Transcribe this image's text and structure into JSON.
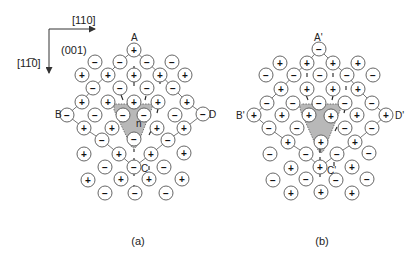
{
  "axes": {
    "horizontal_label": "[110]",
    "vertical_label": "[1̅ 1̅0]",
    "vertical_label_text": "[11̅0]",
    "plane_label": "(001)",
    "origin": [
      49,
      29
    ],
    "h_end": [
      95,
      29
    ],
    "v_end": [
      49,
      73
    ]
  },
  "panels": [
    {
      "id": "a",
      "caption": "(a)",
      "caption_pos": [
        138,
        245
      ],
      "labels": [
        {
          "text": "A",
          "x": 131,
          "y": 41
        },
        {
          "text": "B",
          "x": 55,
          "y": 118
        },
        {
          "text": "D",
          "x": 209,
          "y": 118
        },
        {
          "text": "C",
          "x": 141,
          "y": 172
        },
        {
          "text": "n",
          "x": 136,
          "y": 127
        }
      ],
      "shade": "M114,106 Q113,104 117,104 L149,104 Q153,104 152,108 L137,146 Q134,150 131,146 L114,110 Z",
      "bonds": [
        [
          [
            134,
            50
          ],
          [
            120,
            62
          ],
          [
            108,
            74
          ],
          [
            93,
            88
          ],
          [
            82,
            102
          ],
          [
            67,
            115
          ]
        ],
        [
          [
            134,
            50
          ],
          [
            147,
            62
          ],
          [
            160,
            74
          ],
          [
            173,
            88
          ],
          [
            187,
            102
          ],
          [
            203,
            114
          ]
        ],
        [
          [
            67,
            115
          ],
          [
            84,
            128
          ],
          [
            102,
            140
          ],
          [
            119,
            154
          ],
          [
            134,
            167
          ]
        ],
        [
          [
            203,
            114
          ],
          [
            185,
            128
          ],
          [
            168,
            140
          ],
          [
            151,
            154
          ],
          [
            134,
            167
          ]
        ]
      ],
      "ticks": [
        [
          [
            134,
            66
          ],
          [
            134,
            70
          ]
        ],
        [
          [
            134,
            82
          ],
          [
            134,
            86
          ]
        ],
        [
          [
            160,
            81
          ],
          [
            160,
            84
          ]
        ],
        [
          [
            121,
            95
          ],
          [
            123,
            100
          ]
        ],
        [
          [
            146,
            96
          ],
          [
            145,
            100
          ]
        ],
        [
          [
            158,
            109
          ],
          [
            157,
            113
          ]
        ],
        [
          [
            149,
            135
          ],
          [
            151,
            131
          ]
        ],
        [
          [
            134,
            149
          ],
          [
            134,
            152
          ]
        ],
        [
          [
            134,
            158
          ],
          [
            134,
            162
          ]
        ],
        [
          [
            149,
            166
          ],
          [
            149,
            170
          ]
        ],
        [
          [
            134,
            173
          ],
          [
            134,
            176
          ]
        ],
        [
          [
            134,
            185
          ],
          [
            134,
            189
          ]
        ]
      ],
      "ions": [
        {
          "x": 134,
          "y": 50,
          "s": "+"
        },
        {
          "x": 95,
          "y": 62,
          "s": "−"
        },
        {
          "x": 120,
          "y": 62,
          "s": "−"
        },
        {
          "x": 147,
          "y": 62,
          "s": "−"
        },
        {
          "x": 172,
          "y": 62,
          "s": "−"
        },
        {
          "x": 82,
          "y": 75,
          "s": "+"
        },
        {
          "x": 108,
          "y": 75,
          "s": "+"
        },
        {
          "x": 134,
          "y": 75,
          "s": "+"
        },
        {
          "x": 160,
          "y": 75,
          "s": "+"
        },
        {
          "x": 185,
          "y": 75,
          "s": "+"
        },
        {
          "x": 93,
          "y": 88,
          "s": "−"
        },
        {
          "x": 120,
          "y": 88,
          "s": "−"
        },
        {
          "x": 147,
          "y": 88,
          "s": "−"
        },
        {
          "x": 173,
          "y": 88,
          "s": "−"
        },
        {
          "x": 82,
          "y": 102,
          "s": "+"
        },
        {
          "x": 108,
          "y": 102,
          "s": "+"
        },
        {
          "x": 134,
          "y": 102,
          "s": "+"
        },
        {
          "x": 158,
          "y": 102,
          "s": "+"
        },
        {
          "x": 187,
          "y": 102,
          "s": "+"
        },
        {
          "x": 67,
          "y": 115,
          "s": "−"
        },
        {
          "x": 95,
          "y": 115,
          "s": "−"
        },
        {
          "x": 123,
          "y": 115,
          "s": "−"
        },
        {
          "x": 144,
          "y": 115,
          "s": "−"
        },
        {
          "x": 175,
          "y": 115,
          "s": "−"
        },
        {
          "x": 203,
          "y": 114,
          "s": "−"
        },
        {
          "x": 84,
          "y": 128,
          "s": "+"
        },
        {
          "x": 112,
          "y": 128,
          "s": "+"
        },
        {
          "x": 157,
          "y": 128,
          "s": "+"
        },
        {
          "x": 184,
          "y": 128,
          "s": "+"
        },
        {
          "x": 102,
          "y": 140,
          "s": "−"
        },
        {
          "x": 134,
          "y": 139,
          "s": "−"
        },
        {
          "x": 168,
          "y": 140,
          "s": "−"
        },
        {
          "x": 84,
          "y": 154,
          "s": "+"
        },
        {
          "x": 119,
          "y": 154,
          "s": "+"
        },
        {
          "x": 151,
          "y": 154,
          "s": "+"
        },
        {
          "x": 184,
          "y": 153,
          "s": "+"
        },
        {
          "x": 105,
          "y": 167,
          "s": "−"
        },
        {
          "x": 134,
          "y": 167,
          "s": "−"
        },
        {
          "x": 164,
          "y": 167,
          "s": "−"
        },
        {
          "x": 88,
          "y": 180,
          "s": "+"
        },
        {
          "x": 121,
          "y": 179,
          "s": "+"
        },
        {
          "x": 149,
          "y": 179,
          "s": "+"
        },
        {
          "x": 182,
          "y": 179,
          "s": "+"
        },
        {
          "x": 105,
          "y": 193,
          "s": "−"
        },
        {
          "x": 135,
          "y": 193,
          "s": "−"
        },
        {
          "x": 166,
          "y": 193,
          "s": "−"
        }
      ]
    },
    {
      "id": "b",
      "caption": "(b)",
      "caption_pos": [
        322,
        245
      ],
      "labels": [
        {
          "text": "A'",
          "x": 314,
          "y": 41
        },
        {
          "text": "B'",
          "x": 236,
          "y": 119
        },
        {
          "text": "D'",
          "x": 395,
          "y": 119
        },
        {
          "text": "C'",
          "x": 327,
          "y": 174
        }
      ],
      "shade": "M300,108 Q299,104 304,104 L338,104 Q342,104 341,108 L324,150 Q321,155 318,150 L301,112 Z",
      "bonds": [
        [
          [
            319,
            49
          ],
          [
            307,
            63
          ],
          [
            294,
            75
          ],
          [
            281,
            89
          ],
          [
            267,
            103
          ],
          [
            254,
            115
          ]
        ],
        [
          [
            319,
            49
          ],
          [
            333,
            63
          ],
          [
            347,
            75
          ],
          [
            358,
            89
          ],
          [
            372,
            103
          ],
          [
            386,
            115
          ]
        ],
        [
          [
            254,
            115
          ],
          [
            269,
            128
          ],
          [
            288,
            142
          ],
          [
            306,
            154
          ],
          [
            320,
            167
          ]
        ],
        [
          [
            386,
            115
          ],
          [
            372,
            128
          ],
          [
            355,
            142
          ],
          [
            337,
            154
          ],
          [
            320,
            167
          ]
        ]
      ],
      "ticks": [
        [
          [
            307,
            73
          ],
          [
            307,
            77
          ]
        ],
        [
          [
            333,
            73
          ],
          [
            333,
            77
          ]
        ],
        [
          [
            346,
            86
          ],
          [
            346,
            90
          ]
        ],
        [
          [
            306,
            95
          ],
          [
            308,
            100
          ]
        ],
        [
          [
            333,
            96
          ],
          [
            332,
            100
          ]
        ],
        [
          [
            345,
            109
          ],
          [
            344,
            113
          ]
        ],
        [
          [
            335,
            131
          ],
          [
            337,
            127
          ]
        ],
        [
          [
            320,
            149
          ],
          [
            320,
            153
          ]
        ],
        [
          [
            320,
            157
          ],
          [
            320,
            160
          ]
        ],
        [
          [
            334,
            162
          ],
          [
            334,
            166
          ]
        ],
        [
          [
            320,
            174
          ],
          [
            320,
            177
          ]
        ],
        [
          [
            320,
            185
          ],
          [
            320,
            188
          ]
        ]
      ],
      "ions": [
        {
          "x": 319,
          "y": 49,
          "s": "−"
        },
        {
          "x": 280,
          "y": 63,
          "s": "+"
        },
        {
          "x": 307,
          "y": 63,
          "s": "+"
        },
        {
          "x": 333,
          "y": 63,
          "s": "+"
        },
        {
          "x": 358,
          "y": 63,
          "s": "+"
        },
        {
          "x": 266,
          "y": 75,
          "s": "−"
        },
        {
          "x": 294,
          "y": 75,
          "s": "−"
        },
        {
          "x": 320,
          "y": 75,
          "s": "−"
        },
        {
          "x": 347,
          "y": 75,
          "s": "−"
        },
        {
          "x": 373,
          "y": 75,
          "s": "−"
        },
        {
          "x": 281,
          "y": 89,
          "s": "+"
        },
        {
          "x": 307,
          "y": 89,
          "s": "+"
        },
        {
          "x": 333,
          "y": 89,
          "s": "+"
        },
        {
          "x": 358,
          "y": 89,
          "s": "+"
        },
        {
          "x": 267,
          "y": 103,
          "s": "−"
        },
        {
          "x": 293,
          "y": 103,
          "s": "−"
        },
        {
          "x": 319,
          "y": 103,
          "s": "−"
        },
        {
          "x": 345,
          "y": 103,
          "s": "−"
        },
        {
          "x": 372,
          "y": 103,
          "s": "−"
        },
        {
          "x": 254,
          "y": 115,
          "s": "+"
        },
        {
          "x": 282,
          "y": 115,
          "s": "+"
        },
        {
          "x": 309,
          "y": 115,
          "s": "+"
        },
        {
          "x": 331,
          "y": 116,
          "s": "+"
        },
        {
          "x": 357,
          "y": 115,
          "s": "+"
        },
        {
          "x": 386,
          "y": 115,
          "s": "+"
        },
        {
          "x": 269,
          "y": 128,
          "s": "−"
        },
        {
          "x": 297,
          "y": 128,
          "s": "−"
        },
        {
          "x": 345,
          "y": 128,
          "s": "−"
        },
        {
          "x": 372,
          "y": 128,
          "s": "−"
        },
        {
          "x": 288,
          "y": 142,
          "s": "+"
        },
        {
          "x": 321,
          "y": 142,
          "s": "+"
        },
        {
          "x": 355,
          "y": 142,
          "s": "+"
        },
        {
          "x": 270,
          "y": 154,
          "s": "−"
        },
        {
          "x": 306,
          "y": 154,
          "s": "−"
        },
        {
          "x": 337,
          "y": 154,
          "s": "−"
        },
        {
          "x": 369,
          "y": 153,
          "s": "−"
        },
        {
          "x": 291,
          "y": 168,
          "s": "+"
        },
        {
          "x": 320,
          "y": 167,
          "s": "+"
        },
        {
          "x": 352,
          "y": 167,
          "s": "+"
        },
        {
          "x": 273,
          "y": 180,
          "s": "−"
        },
        {
          "x": 306,
          "y": 179,
          "s": "−"
        },
        {
          "x": 336,
          "y": 180,
          "s": "−"
        },
        {
          "x": 367,
          "y": 179,
          "s": "−"
        },
        {
          "x": 291,
          "y": 193,
          "s": "+"
        },
        {
          "x": 321,
          "y": 192,
          "s": "+"
        },
        {
          "x": 352,
          "y": 193,
          "s": "+"
        }
      ]
    }
  ],
  "ion_radius": 7
}
